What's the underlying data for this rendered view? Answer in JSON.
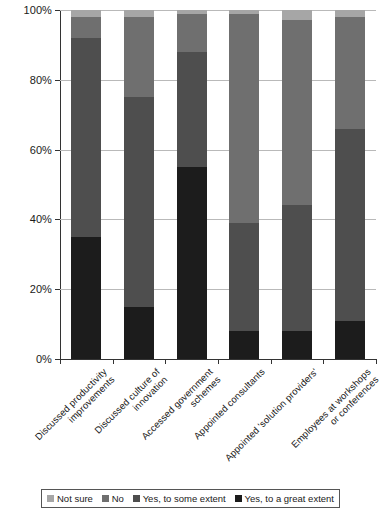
{
  "chart_data": {
    "type": "bar",
    "subtype": "stacked-bar-100-percent",
    "title": "",
    "xlabel": "",
    "ylabel": "",
    "ylim": [
      0,
      100
    ],
    "ytick_labels": [
      "0%",
      "20%",
      "40%",
      "60%",
      "80%",
      "100%"
    ],
    "ytick_values": [
      0,
      20,
      40,
      60,
      80,
      100
    ],
    "grid": true,
    "legend_position": "bottom",
    "categories": [
      "Discussed productivity improvements",
      "Discussed culture of innovation",
      "Accessed government schemes",
      "Appointed consultants",
      "Appointed 'solution providers'",
      "Employees at workshops or conferences"
    ],
    "series": [
      {
        "name": "Yes, to a great extent",
        "color": "#1c1c1c",
        "values": [
          35,
          15,
          55,
          8,
          8,
          11
        ]
      },
      {
        "name": "Yes, to some extent",
        "color": "#4e4e4e",
        "values": [
          57,
          60,
          33,
          31,
          36,
          55
        ]
      },
      {
        "name": "No",
        "color": "#6f6f6f",
        "values": [
          6,
          23,
          11,
          60,
          53,
          32
        ]
      },
      {
        "name": "Not sure",
        "color": "#a6a6a6",
        "values": [
          2,
          2,
          1,
          1,
          3,
          2
        ]
      }
    ]
  },
  "legend": {
    "items": [
      {
        "label": "Not sure",
        "swatch": "legend-swatch-not-sure"
      },
      {
        "label": "No",
        "swatch": "legend-swatch-no"
      },
      {
        "label": "Yes, to some extent",
        "swatch": "legend-swatch-yes-some"
      },
      {
        "label": "Yes, to a great extent",
        "swatch": "legend-swatch-yes-great"
      }
    ]
  },
  "axis": {
    "y_labels": [
      "100%",
      "80%",
      "60%",
      "40%",
      "20%",
      "0%"
    ]
  },
  "colors": {
    "not_sure": "#a6a6a6",
    "no": "#6f6f6f",
    "yes_some": "#4e4e4e",
    "yes_great": "#1c1c1c",
    "gridline": "#b9b9b9",
    "axis": "#333333",
    "background": "#ffffff"
  }
}
